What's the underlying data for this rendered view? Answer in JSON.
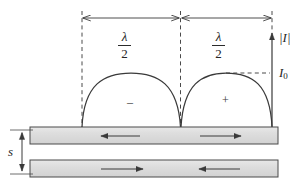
{
  "figure": {
    "labels": {
      "half_wavelength_left": {
        "numerator": "λ",
        "denominator": "2"
      },
      "half_wavelength_right": {
        "numerator": "λ",
        "denominator": "2"
      },
      "current_magnitude_axis": "|I|",
      "current_peak": "I",
      "current_peak_subscript": "0",
      "separation": "s",
      "left_lobe_sign": "–",
      "right_lobe_sign": "+"
    },
    "colors": {
      "line": "#3a3a3a",
      "conductor_fill": "#dcdcdc",
      "conductor_stroke": "#4a4a4a",
      "dashed": "#4a4a4a",
      "background": "#ffffff",
      "text": "#262626"
    },
    "geometry": {
      "dimension_line_y": 18,
      "dimension_left_x": 82,
      "dimension_mid_x": 180,
      "dimension_right_x": 272,
      "baseline_y": 127,
      "arch_peak_y": 73,
      "axis_top_y": 32,
      "i0_dash_y": 73,
      "top_conductor": {
        "x": 30,
        "y": 127,
        "width": 248,
        "height": 17
      },
      "bottom_conductor": {
        "x": 30,
        "y": 160,
        "width": 248,
        "height": 17
      },
      "separation_arrow_x": 22
    },
    "arrows": {
      "top_conductor_left_half": "left",
      "top_conductor_right_half": "right",
      "bottom_conductor_left_half": "right",
      "bottom_conductor_right_half": "left"
    }
  }
}
